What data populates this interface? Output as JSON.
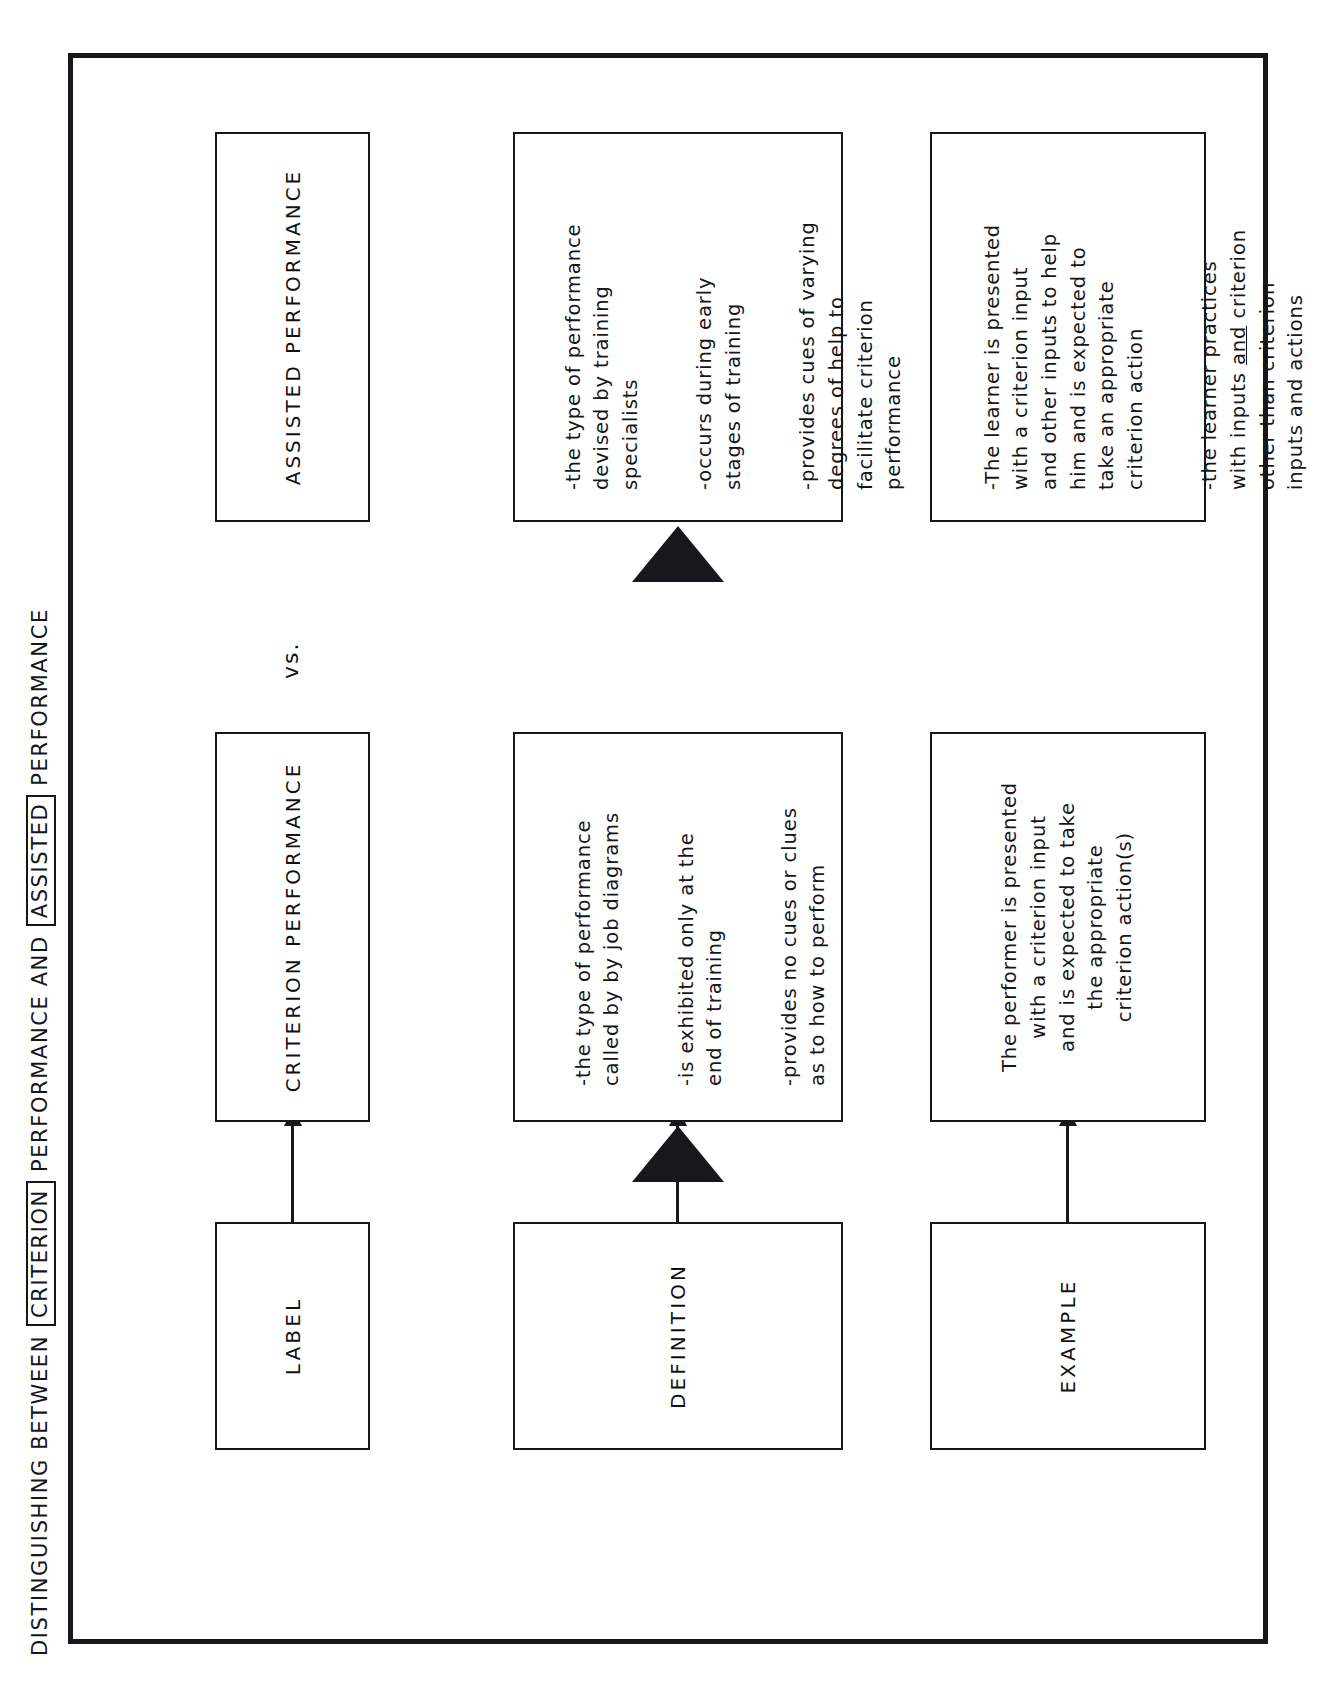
{
  "document": {
    "title_prefix": "DISTINGUISHING BETWEEN",
    "title_boxed_1": "CRITERION",
    "title_middle": "PERFORMANCE AND",
    "title_boxed_2": "ASSISTED",
    "title_suffix": "PERFORMANCE"
  },
  "row_labels": {
    "label": "LABEL",
    "definition": "DEFINITION",
    "example": "EXAMPLE"
  },
  "columns": {
    "criterion_header": "CRITERION PERFORMANCE",
    "versus": "vs.",
    "assisted_header": "ASSISTED PERFORMANCE"
  },
  "criterion": {
    "definition": [
      "-the type of performance\n called by by job diagrams",
      "-is exhibited only at the\n end of training",
      "-provides no cues or clues\n as to how to perform"
    ],
    "example": "The performer is presented\nwith a criterion input\nand is expected to take\nthe appropriate\ncriterion action(s)"
  },
  "assisted": {
    "definition": [
      "-the type of performance\n devised by training\n specialists",
      "-occurs during early\n stages of training",
      "-provides cues of varying\n degrees of help to\n facilitate criterion\n performance"
    ],
    "example_1_pre": "-The learner is presented\n with a criterion input\n and other inputs to help\n him and is expected to\n take an appropriate\n criterion action",
    "example_2_pre": "-the learner practices\n with inputs ",
    "example_2_underlined": "and",
    "example_2_post": " criterion\n other than criterion\n inputs and actions"
  },
  "colors": {
    "ink": "#17181c",
    "paper": "#ffffff"
  },
  "icons": {
    "criterion_definition_marker": "solid-triangle-right-icon",
    "assisted_definition_marker": "solid-triangle-right-icon",
    "label_connector": "arrow-right-icon",
    "definition_connector": "arrow-right-icon",
    "example_connector": "arrow-right-icon"
  }
}
